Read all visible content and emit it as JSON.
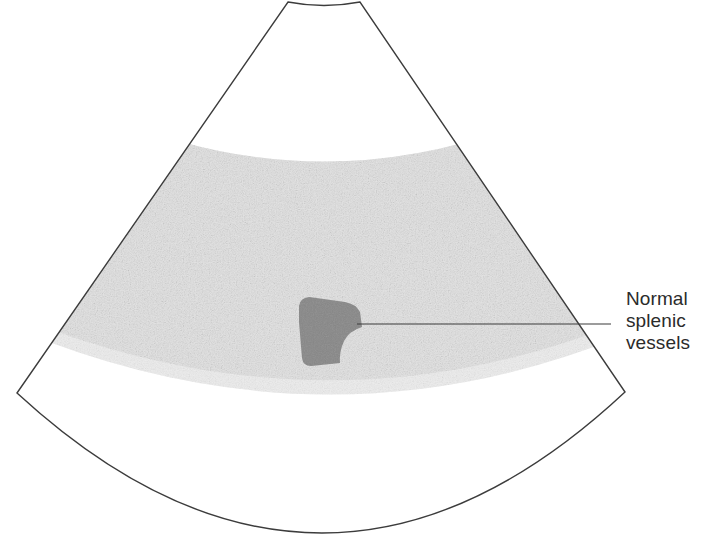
{
  "figure": {
    "modality": "ultrasound",
    "view": "sector / phased-array fan"
  },
  "annotations": [
    {
      "name": "normal-splenic-vessels",
      "lines": [
        "Normal",
        "splenic",
        "vessels"
      ],
      "text": "Normal splenic vessels",
      "text_x": 626,
      "text_y": 288,
      "leader_from_x": 611,
      "leader_from_y": 324,
      "leader_to_x": 357,
      "leader_to_y": 324
    }
  ],
  "sector": {
    "name": "ultrasound-sector-field",
    "apex_arc_left_x": 288,
    "apex_arc_right_x": 360,
    "apex_arc_y": 2,
    "apex_arc_sag": 6,
    "left_corner_x": 17,
    "left_corner_y": 393,
    "right_corner_x": 625,
    "right_corner_y": 392,
    "bottom_arc_center_x": 322,
    "bottom_arc_bottom_y": 533,
    "outline_color": "#3c3c3c",
    "outline_width": 1.4,
    "fill_color": "#ffffff"
  },
  "tissue_band": {
    "name": "splenic-parenchyma-band",
    "label": "Speckled splenic parenchyma",
    "fill_color": "#e2e2e2",
    "speckle_color": "#cfcfcf",
    "top_edge_left_y": 140,
    "top_edge_center_y": 172,
    "bottom_edge_left_y": 300,
    "bottom_edge_center_y": 362
  },
  "vessel": {
    "name": "splenic-vessel-lesion",
    "label": "Normal splenic vessels (hypoechoic)",
    "fill_color": "#878787",
    "edge_color": "#7a7a7a",
    "bbox_x": 294,
    "bbox_y": 296,
    "bbox_width": 68,
    "bbox_height": 70
  },
  "colors": {
    "background": "#ffffff",
    "outline": "#3c3c3c",
    "tissue": "#e2e2e2",
    "vessel": "#878787",
    "text": "#2b2b2b",
    "leader": "#3a3a3a"
  }
}
